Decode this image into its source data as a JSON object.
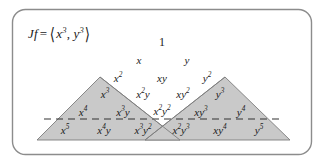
{
  "figure": {
    "name": "pascal-triangle-monomials",
    "formula": {
      "lhs": "Jf",
      "operator": "=",
      "open_bracket": "⟨",
      "component_x": "x",
      "component_x_exp": "3",
      "separator": ",",
      "component_y": "y",
      "component_y_exp": "3",
      "close_bracket": "⟩",
      "full_text": "Jf = ⟨x³, y³⟩"
    },
    "colors": {
      "border": "#8c8c8c",
      "background": "#ffffff",
      "shade_fill": "#c9c9c9",
      "shade_stroke": "#7d7d7d",
      "dashed_line": "#333333",
      "text": "#1a1a1a"
    },
    "triangle_rows": [
      {
        "degree": 0,
        "cells": [
          {
            "base": "1",
            "exp": "",
            "upright": true,
            "x": 162,
            "y": 42
          }
        ]
      },
      {
        "degree": 1,
        "cells": [
          {
            "base": "x",
            "exp": "",
            "upright": false,
            "x": 139,
            "y": 60
          },
          {
            "base": "y",
            "exp": "",
            "upright": false,
            "x": 187,
            "y": 60
          }
        ]
      },
      {
        "degree": 2,
        "cells": [
          {
            "base": "x",
            "exp": "2",
            "upright": false,
            "x": 118,
            "y": 78
          },
          {
            "base": "xy",
            "exp": "",
            "upright": false,
            "x": 162,
            "y": 78
          },
          {
            "base": "y",
            "exp": "2",
            "upright": false,
            "x": 207,
            "y": 78
          }
        ]
      },
      {
        "degree": 3,
        "cells": [
          {
            "base": "x",
            "exp": "3",
            "upright": false,
            "x": 105,
            "y": 94
          },
          {
            "base": "x",
            "exp": "2",
            "tail": "y",
            "upright": false,
            "x": 143,
            "y": 94
          },
          {
            "base": "xy",
            "exp": "2",
            "upright": false,
            "x": 183,
            "y": 94
          },
          {
            "base": "y",
            "exp": "3",
            "upright": false,
            "x": 220,
            "y": 94
          }
        ]
      },
      {
        "degree": 4,
        "cells": [
          {
            "base": "x",
            "exp": "4",
            "upright": false,
            "x": 83,
            "y": 112
          },
          {
            "base": "x",
            "exp": "3",
            "tail": "y",
            "upright": false,
            "x": 123,
            "y": 112
          },
          {
            "base": "x",
            "exp": "2",
            "tail": "y",
            "tail_exp": "2",
            "upright": false,
            "x": 162,
            "y": 111
          },
          {
            "base": "xy",
            "exp": "3",
            "upright": false,
            "x": 201,
            "y": 112
          },
          {
            "base": "y",
            "exp": "4",
            "upright": false,
            "x": 241,
            "y": 112
          }
        ]
      },
      {
        "degree": 5,
        "cells": [
          {
            "base": "x",
            "exp": "5",
            "upright": false,
            "x": 65,
            "y": 130
          },
          {
            "base": "x",
            "exp": "4",
            "tail": "y",
            "upright": false,
            "x": 104,
            "y": 130
          },
          {
            "base": "x",
            "exp": "3",
            "tail": "y",
            "tail_exp": "2",
            "upright": false,
            "x": 143,
            "y": 130
          },
          {
            "base": "x",
            "exp": "2",
            "tail": "y",
            "tail_exp": "3",
            "upright": false,
            "x": 181,
            "y": 130
          },
          {
            "base": "xy",
            "exp": "4",
            "upright": false,
            "x": 220,
            "y": 130
          },
          {
            "base": "y",
            "exp": "5",
            "upright": false,
            "x": 259,
            "y": 130
          }
        ]
      }
    ],
    "shaded_regions": [
      {
        "name": "left-shaded-triangle",
        "apex_x": 100,
        "apex_y": 77,
        "base_left_x": 37,
        "base_right_x": 180,
        "base_y": 140
      },
      {
        "name": "right-shaded-triangle",
        "apex_x": 225,
        "apex_y": 77,
        "base_left_x": 145,
        "base_right_x": 290,
        "base_y": 140
      }
    ],
    "dashed_line": {
      "name": "degree-4-dashed-line",
      "x1": 44,
      "x2": 284,
      "y": 119
    },
    "border_rect": {
      "x": 12,
      "y": 9,
      "width": 300,
      "height": 146,
      "radius": 13
    }
  }
}
